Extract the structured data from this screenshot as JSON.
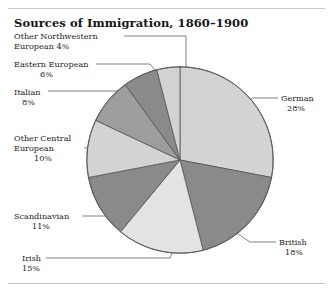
{
  "header": {
    "title": "Sources of Immigration, 1860–1900"
  },
  "colors": {
    "light": "#d3d3d3",
    "pale": "#e3e3e3",
    "mid": "#9d9d9d",
    "dark": "#8a8a8a",
    "darker": "#7f7f7f",
    "outline": "#555558",
    "leader": "#4a4a4e",
    "rule": "#c9c9cf",
    "text": "#1b1b20"
  },
  "chart_data": {
    "type": "pie",
    "title": "Sources of Immigration, 1860–1900",
    "xlabel": "",
    "ylabel": "",
    "legend_position": "callout-labels",
    "grid": false,
    "total": 100,
    "start_angle_deg": 0,
    "direction": "clockwise",
    "slices": [
      {
        "label": "German",
        "pct": 28,
        "pct_text": "28%",
        "color": "#d3d3d3"
      },
      {
        "label": "British",
        "pct": 18,
        "pct_text": "18%",
        "color": "#8a8a8a"
      },
      {
        "label": "Irish",
        "pct": 15,
        "pct_text": "15%",
        "color": "#e3e3e3"
      },
      {
        "label": "Scandinavian",
        "pct": 11,
        "pct_text": "11%",
        "color": "#8a8a8a"
      },
      {
        "label": "Other Central European",
        "pct": 10,
        "pct_text": "10%",
        "color": "#d3d3d3"
      },
      {
        "label": "Italian",
        "pct": 8,
        "pct_text": "8%",
        "color": "#9d9d9d"
      },
      {
        "label": "Eastern European",
        "pct": 6,
        "pct_text": "6%",
        "color": "#8a8a8a"
      },
      {
        "label": "Other Northwestern European",
        "pct": 4,
        "pct_text": "4%",
        "color": "#d3d3d3"
      }
    ]
  },
  "labels": {
    "other_nw": {
      "line1": "Other Northwestern",
      "line2": "European  4%"
    },
    "eastern": {
      "line1": "Eastern European",
      "pct": "6%"
    },
    "italian": {
      "line1": "Italian",
      "pct": "8%"
    },
    "other_central": {
      "line1": "Other Central",
      "line2": "European",
      "pct": "10%"
    },
    "scandinavian": {
      "line1": "Scandinavian",
      "pct": "11%"
    },
    "irish": {
      "line1": "Irish",
      "pct": "15%"
    },
    "german": {
      "line1": "German",
      "pct": "28%"
    },
    "british": {
      "line1": "British",
      "pct": "18%"
    }
  }
}
